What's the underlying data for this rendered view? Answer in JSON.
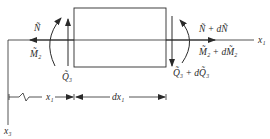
{
  "diagram": {
    "type": "beam element free-body diagram",
    "axes": {
      "horizontal": "x₁",
      "vertical": "x₃"
    },
    "left_face": {
      "axial_force": "Ñ",
      "moment": "M̃₂",
      "shear_force": "Q̃₃"
    },
    "right_face": {
      "axial_force": "Ñ + dÑ",
      "moment": "M̃₂ + dM̃₂",
      "shear_force": "Q̃₃ + dQ̃₃"
    },
    "dimensions": {
      "position": "x₁",
      "element_length": "dx₁"
    },
    "colors": {
      "line": "#2a2a2a",
      "background": "#ffffff"
    }
  }
}
